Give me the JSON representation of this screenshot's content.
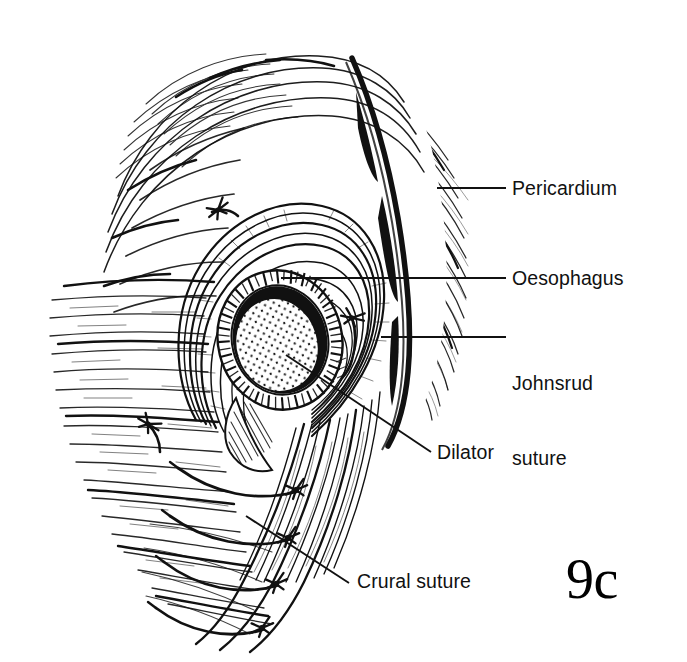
{
  "figure": {
    "number": "9c",
    "background_color": "#ffffff",
    "ink_color": "#111111"
  },
  "labels": {
    "pericardium": "Pericardium",
    "oesophagus": "Oesophagus",
    "johnsrud_line1": "Johnsrud",
    "johnsrud_line2": "suture",
    "dilator": "Dilator",
    "crural_suture": "Crural suture"
  },
  "annotations": {
    "leader_lines": [
      {
        "name": "pericardium-leader",
        "x1": 437,
        "y1": 188,
        "x2": 506,
        "y2": 188
      },
      {
        "name": "oesophagus-leader",
        "x1": 281,
        "y1": 278,
        "x2": 506,
        "y2": 278
      },
      {
        "name": "johnsrud-leader",
        "x1": 381,
        "y1": 337,
        "x2": 506,
        "y2": 337
      },
      {
        "name": "dilator-leader",
        "x1": 286,
        "y1": 355,
        "x2": 431,
        "y2": 452
      },
      {
        "name": "crural-leader",
        "x1": 246,
        "y1": 516,
        "x2": 349,
        "y2": 583
      }
    ]
  },
  "structures": {
    "pericardium": "radiating fibrous hatching of the pericardium",
    "oesophagus": "oesophageal wall cross-section with circular muscle hatching",
    "lumen_shadow": "black crescent of the collapsed lumen",
    "dilator": "stippled oval dilator within the oesophageal lumen",
    "johnsrud_suture": "suture knot anchoring pericardium to crus",
    "crural_sutures": "four interrupted sutures approximating the crura",
    "diaphragm_crus": "muscular crural bundles sweeping inferiorly"
  }
}
